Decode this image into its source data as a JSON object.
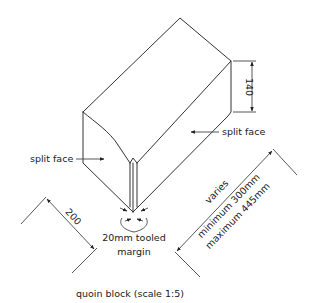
{
  "diagram": {
    "title": "quoin block (scale 1:5)",
    "labels": {
      "split_face_left": "split face",
      "split_face_right": "split face",
      "margin_line1": "20mm tooled",
      "margin_line2": "margin"
    },
    "dimensions": {
      "height": "140",
      "depth": "200",
      "length_line1": "varies",
      "length_line2": "minimum 300mm",
      "length_line3": "maximum 445mm"
    },
    "colors": {
      "line": "#333333",
      "text": "#1a1a1a",
      "background": "#ffffff"
    }
  }
}
